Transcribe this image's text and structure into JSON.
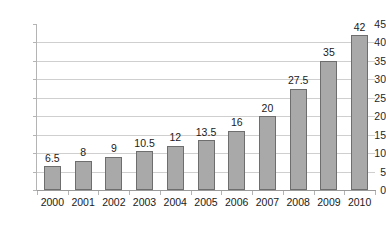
{
  "chart_data": {
    "type": "bar",
    "title": "",
    "subtitle": "",
    "xlabel": "",
    "ylabel": "",
    "categories": [
      "2000",
      "2001",
      "2002",
      "2003",
      "2004",
      "2005",
      "2006",
      "2007",
      "2008",
      "2009",
      "2010"
    ],
    "values": [
      6.5,
      8,
      9,
      10.5,
      12,
      13.5,
      16,
      20,
      27.5,
      35,
      42
    ],
    "data_labels": [
      "6.5",
      "8",
      "9",
      "10.5",
      "12",
      "13.5",
      "16",
      "20",
      "27.5",
      "35",
      "42"
    ],
    "ylim": [
      0,
      45
    ],
    "ytick_step": 5,
    "ytick_labels": [
      "45",
      "40",
      "35",
      "30",
      "25",
      "20",
      "15",
      "10",
      "5",
      "0"
    ],
    "ytick_values": [
      45,
      40,
      35,
      30,
      25,
      20,
      15,
      10,
      5,
      0
    ],
    "grid": true,
    "grid_axis": "y",
    "legend": false,
    "legend_position": "none",
    "colors": {
      "bar_fill": "#a9a9a9",
      "bar_border": "#6e6e6e",
      "gridline": "#cfcfcf",
      "axis": "#9a9a9a",
      "text": "#1a1a1a",
      "background": "#ffffff"
    }
  }
}
